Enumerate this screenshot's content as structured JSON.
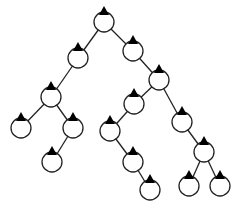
{
  "diagram": {
    "type": "binary-tree",
    "node_radius": 10,
    "colors": {
      "stroke": "#222222",
      "fill": "#ffffff",
      "marker": "#000000"
    },
    "nodes": [
      {
        "id": "n0",
        "x": 104,
        "y": 22
      },
      {
        "id": "n1",
        "x": 78,
        "y": 58
      },
      {
        "id": "n2",
        "x": 133,
        "y": 51
      },
      {
        "id": "n3",
        "x": 51,
        "y": 97
      },
      {
        "id": "n4",
        "x": 159,
        "y": 80
      },
      {
        "id": "n5",
        "x": 21,
        "y": 128
      },
      {
        "id": "n6",
        "x": 73,
        "y": 128
      },
      {
        "id": "n7",
        "x": 52,
        "y": 162
      },
      {
        "id": "n8",
        "x": 134,
        "y": 104
      },
      {
        "id": "n9",
        "x": 182,
        "y": 122
      },
      {
        "id": "n10",
        "x": 110,
        "y": 131
      },
      {
        "id": "n11",
        "x": 133,
        "y": 162
      },
      {
        "id": "n12",
        "x": 150,
        "y": 190
      },
      {
        "id": "n13",
        "x": 204,
        "y": 152
      },
      {
        "id": "n14",
        "x": 189,
        "y": 186
      },
      {
        "id": "n15",
        "x": 220,
        "y": 186
      }
    ],
    "edges": [
      [
        "n0",
        "n1"
      ],
      [
        "n0",
        "n2"
      ],
      [
        "n1",
        "n3"
      ],
      [
        "n2",
        "n4"
      ],
      [
        "n3",
        "n5"
      ],
      [
        "n3",
        "n6"
      ],
      [
        "n6",
        "n7"
      ],
      [
        "n4",
        "n8"
      ],
      [
        "n4",
        "n9"
      ],
      [
        "n8",
        "n10"
      ],
      [
        "n10",
        "n11"
      ],
      [
        "n11",
        "n12"
      ],
      [
        "n9",
        "n13"
      ],
      [
        "n13",
        "n14"
      ],
      [
        "n13",
        "n15"
      ]
    ]
  }
}
